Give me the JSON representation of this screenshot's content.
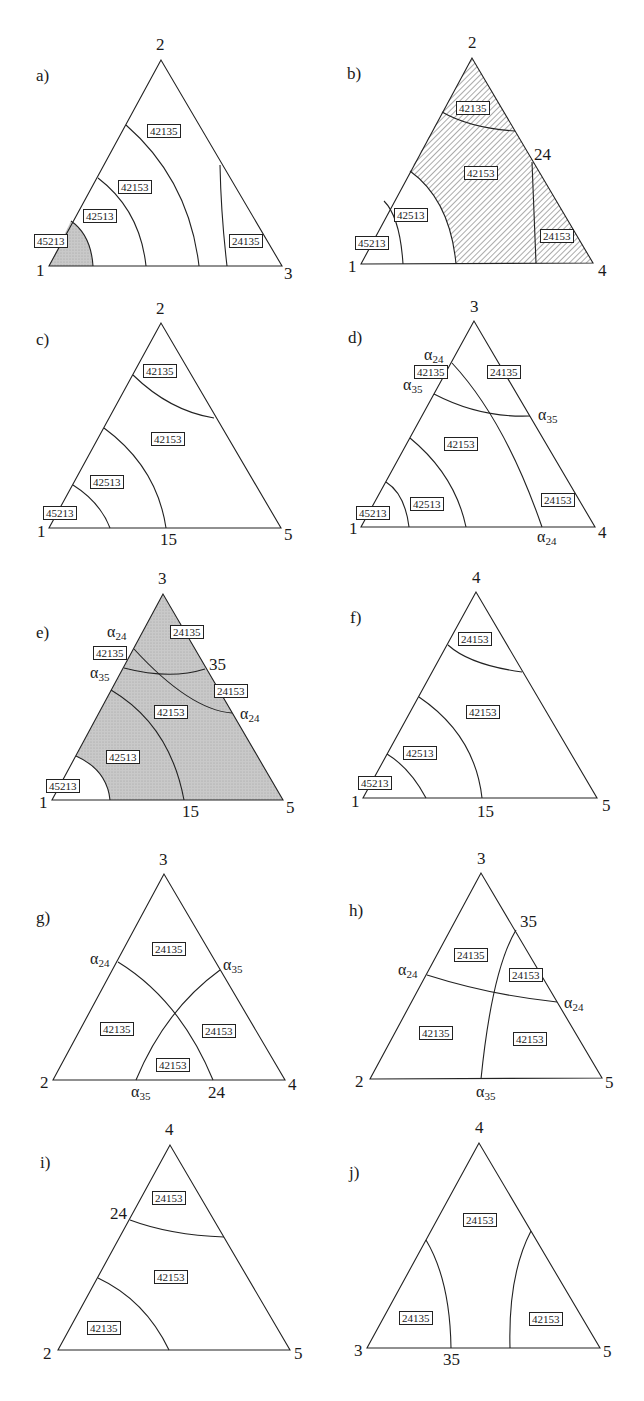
{
  "figure": {
    "panels": [
      {
        "id": "a",
        "label": "a)",
        "shading": "bottom-left-gray",
        "vertices": {
          "top": "2",
          "left": "1",
          "right": "3"
        },
        "edge_marks": [],
        "regions": [
          "45213",
          "42513",
          "42153",
          "42135",
          "24135"
        ]
      },
      {
        "id": "b",
        "label": "b)",
        "shading": "hatched-right",
        "vertices": {
          "top": "2",
          "left": "1",
          "right": "4"
        },
        "edge_marks": [
          "24"
        ],
        "regions": [
          "42135",
          "42153",
          "42513",
          "45213",
          "24153"
        ]
      },
      {
        "id": "c",
        "label": "c)",
        "shading": "none",
        "vertices": {
          "top": "2",
          "left": "1",
          "right": "5"
        },
        "edge_marks": [
          "15"
        ],
        "regions": [
          "42135",
          "42153",
          "42513",
          "45213"
        ]
      },
      {
        "id": "d",
        "label": "d)",
        "shading": "none",
        "vertices": {
          "top": "3",
          "left": "1",
          "right": "4"
        },
        "edge_marks": [
          "α24",
          "α35",
          "α35",
          "α24"
        ],
        "regions": [
          "42135",
          "24135",
          "42153",
          "45213",
          "42513",
          "24153"
        ]
      },
      {
        "id": "e",
        "label": "e)",
        "shading": "gray-except-bottom-left",
        "vertices": {
          "top": "3",
          "left": "1",
          "right": "5"
        },
        "edge_marks": [
          "α24",
          "α35",
          "35",
          "α24",
          "15"
        ],
        "regions": [
          "24135",
          "42135",
          "24153",
          "42153",
          "42513",
          "45213"
        ]
      },
      {
        "id": "f",
        "label": "f)",
        "shading": "none",
        "vertices": {
          "top": "4",
          "left": "1",
          "right": "5"
        },
        "edge_marks": [
          "15"
        ],
        "regions": [
          "24153",
          "42153",
          "42513",
          "45213"
        ]
      },
      {
        "id": "g",
        "label": "g)",
        "shading": "none",
        "vertices": {
          "top": "3",
          "left": "2",
          "right": "4"
        },
        "edge_marks": [
          "α24",
          "α35",
          "α35",
          "24"
        ],
        "regions": [
          "24135",
          "42135",
          "24153",
          "42153"
        ]
      },
      {
        "id": "h",
        "label": "h)",
        "shading": "none",
        "vertices": {
          "top": "3",
          "left": "2",
          "right": "5"
        },
        "edge_marks": [
          "35",
          "α24",
          "α24",
          "α35"
        ],
        "regions": [
          "24135",
          "24153",
          "42135",
          "42153"
        ]
      },
      {
        "id": "i",
        "label": "i)",
        "shading": "none",
        "vertices": {
          "top": "4",
          "left": "2",
          "right": "5"
        },
        "edge_marks": [
          "24"
        ],
        "regions": [
          "24153",
          "42153",
          "42135"
        ]
      },
      {
        "id": "j",
        "label": "j)",
        "shading": "none",
        "vertices": {
          "top": "4",
          "left": "3",
          "right": "5"
        },
        "edge_marks": [
          "35"
        ],
        "regions": [
          "24153",
          "24135",
          "42153"
        ]
      }
    ],
    "alpha": "α",
    "sub24": "24",
    "sub35": "35"
  }
}
